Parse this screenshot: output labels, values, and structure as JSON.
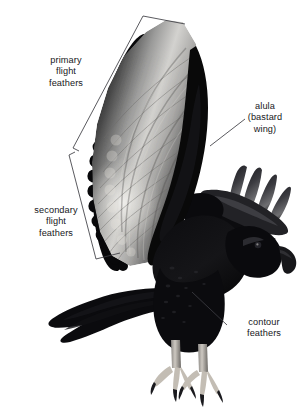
{
  "figure": {
    "background_color": "#ffffff",
    "ink_color": "#17171a",
    "line_color": "#3c3c42"
  },
  "labels": [
    {
      "id": "primary",
      "name": "primary-flight-feathers-label",
      "lines": [
        "primary",
        "flight",
        "feathers"
      ],
      "annotation_type": "bracket",
      "points_to": "outer-wing-primaries"
    },
    {
      "id": "secondary",
      "name": "secondary-flight-feathers-label",
      "lines": [
        "secondary",
        "flight",
        "feathers"
      ],
      "annotation_type": "bracket",
      "points_to": "inner-wing-secondaries"
    },
    {
      "id": "alula",
      "name": "alula-label",
      "lines": [
        "alula",
        "(bastard",
        "wing)"
      ],
      "annotation_type": "leader-line",
      "points_to": "wing-thumb-alula"
    },
    {
      "id": "contour",
      "name": "contour-feathers-label",
      "lines": [
        "contour",
        "feathers"
      ],
      "annotation_type": "leader-line",
      "points_to": "body-plumage"
    }
  ],
  "annotations": {
    "primary_bracket": {
      "name": "primary-bracket",
      "path": "M 185 24 L 143 16 L 73 148 L 79 151"
    },
    "secondary_bracket": {
      "name": "secondary-bracket",
      "path": "M 75 152 L 69 155 L 96 259 L 120 253"
    },
    "alula_leader": {
      "name": "alula-leader-line",
      "path": "M 210 146 L 245 119"
    },
    "contour_leader": {
      "name": "contour-leader-line",
      "path": "M 192 292 L 227 325"
    }
  }
}
